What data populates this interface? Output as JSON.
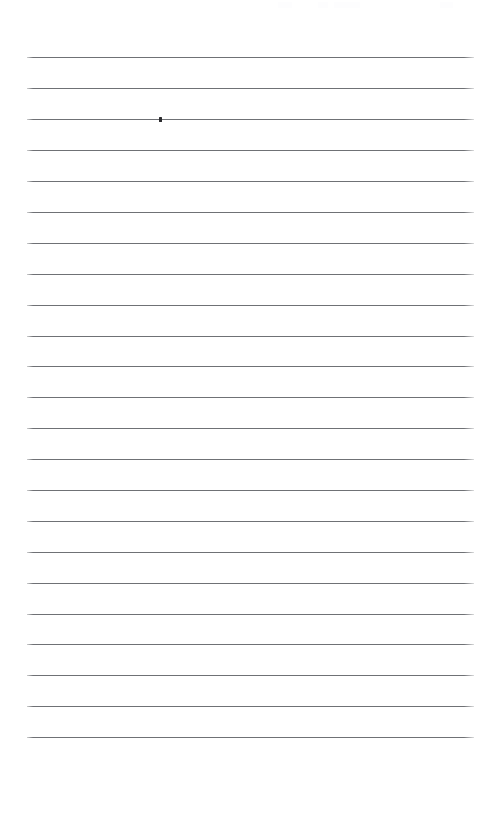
{
  "document": {
    "kind": "ruled-notebook-page",
    "title": "Blank ruled page",
    "page_width": 495,
    "page_height": 818,
    "background_color": "#ffffff",
    "content_text": "",
    "is_blank": true
  },
  "rules": {
    "count": 23,
    "color": "#6f7175",
    "halo_color": "#d9dadc",
    "thickness": 1,
    "left_x": 27,
    "right_x": 474,
    "line_length": 447,
    "first_y": 57,
    "spacing": 30.9,
    "positions_y": [
      57,
      88,
      119,
      150,
      181,
      212,
      243,
      274,
      305,
      336,
      366,
      397,
      428,
      459,
      490,
      521,
      552,
      583,
      614,
      644,
      675,
      706,
      737
    ]
  },
  "marks": {
    "ink_mark": {
      "label": "pen mark",
      "x": 159,
      "y": 117,
      "width": 3,
      "height": 5,
      "color": "#2b2b2e",
      "on_rule_index": 2
    }
  },
  "margins": {
    "top_blank_height": 57,
    "bottom_blank_height": 81,
    "left_blank_width": 27,
    "right_blank_width": 21
  }
}
